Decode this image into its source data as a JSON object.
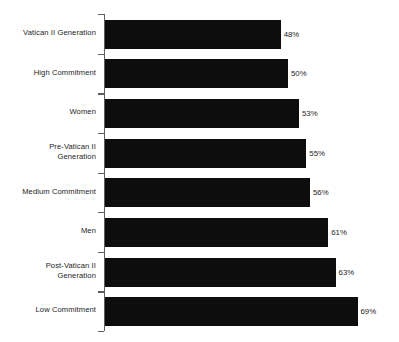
{
  "chart_data": {
    "type": "bar",
    "orientation": "horizontal",
    "title": "",
    "subtitle": "",
    "xlabel": "",
    "ylabel": "",
    "xlim": [
      0,
      80
    ],
    "grid": false,
    "legend": null,
    "value_suffix": "%",
    "bar_color": "#0d0d0d",
    "axis_color": "#5e5e5e",
    "categories": [
      "Vatican II Generation",
      "High Commitment",
      "Women",
      "Pre-Vatican II\nGeneration",
      "Medium Commitment",
      "Men",
      "Post-Vatican II\nGeneration",
      "Low Commitment"
    ],
    "values": [
      48,
      50,
      53,
      55,
      56,
      61,
      63,
      69
    ],
    "labels": [
      "48%",
      "50%",
      "53%",
      "55%",
      "56%",
      "61%",
      "63%",
      "69%"
    ]
  }
}
